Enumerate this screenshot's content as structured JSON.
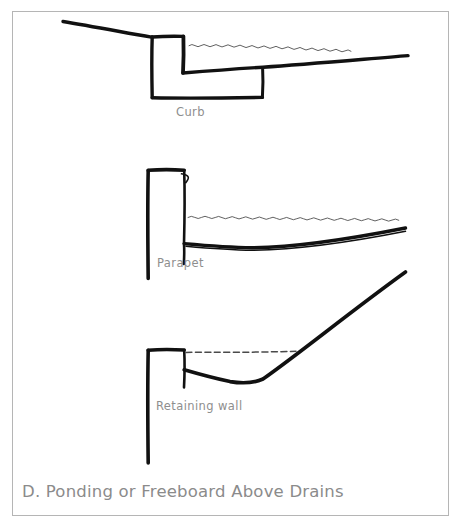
{
  "figure": {
    "caption": "D. Ponding or Freeboard Above Drains",
    "frame_color": "#b5b5b5",
    "ink_color": "#111111",
    "label_color": "#8e8e8e",
    "caption_color": "#8b8b8b",
    "water_line_color": "#3a3a3a"
  },
  "panels": [
    {
      "id": "curb",
      "label": "Curb",
      "description": "Roof slope draining to a curbed opening with ponded water shown as a wavy line"
    },
    {
      "id": "parapet",
      "label": "Parapet",
      "description": "Parapet wall with roof deck sagging and ponded water shown as a wavy line"
    },
    {
      "id": "retaining-wall",
      "label": "Retaining wall",
      "description": "Retaining wall with steeply rising roof deck and freeboard shown as a dashed line"
    }
  ],
  "sketch": {
    "curb": {
      "roof_slope": "M63,21 L152,37",
      "curb_box_left": "M152,37 L152,98",
      "curb_box_top": "M152,37 L183,36",
      "curb_box_right": "M183,36 L183,73",
      "curb_base": "M152,98 L262,97",
      "deck_line": "M183,73 L262,68 L408,56",
      "inner_wall": "M262,68 L262,97",
      "water_squiggle_y": 47,
      "water_squiggle_x_start": 190,
      "water_squiggle_x_end": 352
    },
    "parapet": {
      "wall_left": "M148,170 L148,278",
      "wall_top": "M148,170 L184,170",
      "wall_right": "M184,170 L184,243",
      "flashing_hook": "M181,174 L188,176 L186,182",
      "deck_line": "M184,243 L252,247 L405,228",
      "deck_line_2": "M184,245 L252,249 L405,231",
      "water_squiggle_y": 219,
      "water_squiggle_x_start": 188,
      "water_squiggle_x_end": 406
    },
    "retaining_wall": {
      "wall_left": "M148,350 L148,462",
      "wall_top": "M148,350 L184,349",
      "wall_right": "M184,349 L184,387",
      "deck_line": "M184,370 L215,378 L247,383 L262,380 L405,272",
      "dashed_line_y": 352,
      "dashed_x_start": 186,
      "dashed_x_end": 296
    }
  }
}
